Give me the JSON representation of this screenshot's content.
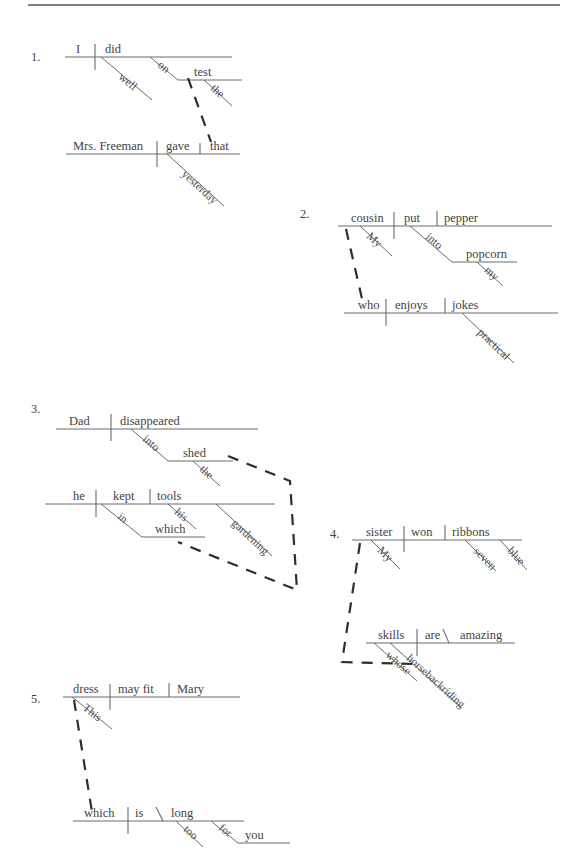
{
  "page": {
    "top_rule": {
      "x1": 28,
      "x2": 560,
      "y": 5
    }
  },
  "items": [
    {
      "number": "1.",
      "number_pos": {
        "x": 31,
        "y": 61
      },
      "clauses": [
        {
          "name": "main-clause",
          "baseline": {
            "x1": 65,
            "x2": 232,
            "y": 57
          },
          "subject": {
            "text": "I",
            "x": 76,
            "y": 53
          },
          "verb": {
            "text": "did",
            "x": 105,
            "y": 53
          },
          "subject_verb_divider": {
            "x": 95,
            "y1": 44,
            "y2": 70
          },
          "modifiers": [
            {
              "text": "well",
              "x1": 101,
              "y1": 57,
              "x2": 152,
              "y2": 100,
              "label_x": 118,
              "label_y": 78
            },
            {
              "text": "on",
              "x1": 150,
              "y1": 57,
              "x2": 178,
              "y2": 80,
              "label_x": 157,
              "label_y": 66
            }
          ],
          "object_line": {
            "text": "test",
            "x1": 178,
            "x2": 242,
            "y": 80,
            "label_x": 194,
            "label_y": 76
          },
          "object_modifier": {
            "text": "the",
            "x1": 204,
            "y1": 80,
            "x2": 232,
            "y2": 106,
            "label_x": 210,
            "label_y": 89
          }
        },
        {
          "name": "relative-clause",
          "baseline": {
            "x1": 66,
            "x2": 240,
            "y": 154
          },
          "subject": {
            "text": "Mrs. Freeman",
            "x": 73,
            "y": 150
          },
          "verb": {
            "text": "gave",
            "x": 166,
            "y": 150
          },
          "object": {
            "text": "that",
            "x": 210,
            "y": 150
          },
          "subject_verb_divider": {
            "x": 157,
            "y1": 141,
            "y2": 167
          },
          "verb_object_divider": {
            "x": 200,
            "y1": 143,
            "y2": 154
          },
          "modifiers": [
            {
              "text": "yesterday",
              "x1": 167,
              "y1": 154,
              "x2": 224,
              "y2": 206,
              "label_x": 181,
              "label_y": 175
            }
          ]
        }
      ],
      "dashed_connector": {
        "points": "188,78 211,142"
      }
    },
    {
      "number": "2.",
      "number_pos": {
        "x": 300,
        "y": 218
      },
      "clauses": [
        {
          "name": "main-clause",
          "baseline": {
            "x1": 338,
            "x2": 552,
            "y": 226
          },
          "subject": {
            "text": "cousin",
            "x": 351,
            "y": 222
          },
          "verb": {
            "text": "put",
            "x": 404,
            "y": 222
          },
          "object": {
            "text": "pepper",
            "x": 444,
            "y": 222
          },
          "subject_verb_divider": {
            "x": 394,
            "y1": 212,
            "y2": 239
          },
          "verb_object_divider": {
            "x": 437,
            "y1": 211,
            "y2": 226
          },
          "modifiers": [
            {
              "text": "My",
              "x1": 360,
              "y1": 226,
              "x2": 392,
              "y2": 256,
              "label_x": 366,
              "label_y": 237
            },
            {
              "text": "into",
              "x1": 410,
              "y1": 226,
              "x2": 452,
              "y2": 262,
              "label_x": 425,
              "label_y": 238
            }
          ],
          "object_line": {
            "text": "popcorn",
            "x1": 452,
            "x2": 517,
            "y": 262,
            "label_x": 466,
            "label_y": 258
          },
          "object_modifier": {
            "text": "my",
            "x1": 477,
            "y1": 262,
            "x2": 503,
            "y2": 286,
            "label_x": 484,
            "label_y": 271
          }
        },
        {
          "name": "relative-clause",
          "baseline": {
            "x1": 344,
            "x2": 558,
            "y": 313
          },
          "subject": {
            "text": "who",
            "x": 358,
            "y": 309
          },
          "verb": {
            "text": "enjoys",
            "x": 395,
            "y": 309
          },
          "object": {
            "text": "jokes",
            "x": 452,
            "y": 309
          },
          "subject_verb_divider": {
            "x": 386,
            "y1": 299,
            "y2": 326
          },
          "verb_object_divider": {
            "x": 445,
            "y1": 298,
            "y2": 313
          },
          "modifiers": [
            {
              "text": "practical",
              "x1": 462,
              "y1": 313,
              "x2": 514,
              "y2": 363,
              "label_x": 477,
              "label_y": 333
            }
          ]
        }
      ],
      "dashed_connector": {
        "points": "346,229 363,303"
      }
    },
    {
      "number": "3.",
      "number_pos": {
        "x": 31,
        "y": 413
      },
      "clauses": [
        {
          "name": "main-clause",
          "baseline": {
            "x1": 56,
            "x2": 258,
            "y": 429
          },
          "subject": {
            "text": "Dad",
            "x": 69,
            "y": 425
          },
          "verb": {
            "text": "disappeared",
            "x": 120,
            "y": 425
          },
          "subject_verb_divider": {
            "x": 111,
            "y1": 414,
            "y2": 441
          },
          "modifiers": [
            {
              "text": "into",
              "x1": 131,
              "y1": 429,
              "x2": 168,
              "y2": 461,
              "label_x": 142,
              "label_y": 440
            }
          ],
          "object_line": {
            "text": "shed",
            "x1": 168,
            "x2": 233,
            "y": 461,
            "label_x": 183,
            "label_y": 457
          },
          "object_modifier": {
            "text": "the",
            "x1": 193,
            "y1": 461,
            "x2": 220,
            "y2": 486,
            "label_x": 199,
            "label_y": 470
          }
        },
        {
          "name": "relative-clause",
          "baseline": {
            "x1": 45,
            "x2": 275,
            "y": 504
          },
          "subject": {
            "text": "he",
            "x": 73,
            "y": 500
          },
          "verb": {
            "text": "kept",
            "x": 113,
            "y": 500
          },
          "object": {
            "text": "tools",
            "x": 157,
            "y": 500
          },
          "subject_verb_divider": {
            "x": 96,
            "y1": 490,
            "y2": 517
          },
          "verb_object_divider": {
            "x": 150,
            "y1": 489,
            "y2": 504
          },
          "modifiers": [
            {
              "text": "in",
              "x1": 101,
              "y1": 504,
              "x2": 142,
              "y2": 537,
              "label_x": 117,
              "label_y": 518
            },
            {
              "text": "his",
              "x1": 168,
              "y1": 504,
              "x2": 196,
              "y2": 529,
              "label_x": 174,
              "label_y": 513
            },
            {
              "text": "gardening",
              "x1": 216,
              "y1": 504,
              "x2": 272,
              "y2": 556,
              "label_x": 231,
              "label_y": 524
            }
          ],
          "object_line": {
            "text": "which",
            "x1": 142,
            "x2": 205,
            "y": 537,
            "label_x": 155,
            "label_y": 533
          }
        }
      ],
      "dashed_connector": {
        "points": "228,456 290,481 297,590 178,542"
      }
    },
    {
      "number": "4.",
      "number_pos": {
        "x": 330,
        "y": 538
      },
      "clauses": [
        {
          "name": "main-clause",
          "baseline": {
            "x1": 352,
            "x2": 522,
            "y": 540
          },
          "subject": {
            "text": "sister",
            "x": 366,
            "y": 536
          },
          "verb": {
            "text": "won",
            "x": 411,
            "y": 536
          },
          "object": {
            "text": "ribbons",
            "x": 452,
            "y": 536
          },
          "subject_verb_divider": {
            "x": 404,
            "y1": 526,
            "y2": 552
          },
          "verb_object_divider": {
            "x": 445,
            "y1": 525,
            "y2": 540
          },
          "modifiers": [
            {
              "text": "My",
              "x1": 371,
              "y1": 540,
              "x2": 400,
              "y2": 569,
              "label_x": 377,
              "label_y": 551
            },
            {
              "text": "seven",
              "x1": 465,
              "y1": 540,
              "x2": 496,
              "y2": 571,
              "label_x": 473,
              "label_y": 552
            },
            {
              "text": "blue",
              "x1": 500,
              "y1": 540,
              "x2": 527,
              "y2": 570,
              "label_x": 507,
              "label_y": 551
            }
          ]
        },
        {
          "name": "relative-clause",
          "baseline": {
            "x1": 366,
            "x2": 515,
            "y": 643
          },
          "subject": {
            "text": "skills",
            "x": 378,
            "y": 639
          },
          "verb": {
            "text": "are",
            "x": 425,
            "y": 639
          },
          "complement": {
            "text": "amazing",
            "x": 460,
            "y": 639
          },
          "subject_verb_divider": {
            "x": 417,
            "y1": 629,
            "y2": 656
          },
          "predicate_slash": {
            "x1": 449,
            "y1": 643,
            "x2": 443,
            "y2": 629
          },
          "modifiers": [
            {
              "text": "whose",
              "x1": 374,
              "y1": 643,
              "x2": 417,
              "y2": 681,
              "label_x": 385,
              "label_y": 656
            },
            {
              "text": "horsebackriding",
              "x1": 390,
              "y1": 643,
              "x2": 462,
              "y2": 708,
              "label_x": 406,
              "label_y": 659
            }
          ]
        }
      ],
      "dashed_connector": {
        "points": "360,543 342,662 412,664"
      }
    },
    {
      "number": "5.",
      "number_pos": {
        "x": 31,
        "y": 703
      },
      "clauses": [
        {
          "name": "main-clause",
          "baseline": {
            "x1": 63,
            "x2": 240,
            "y": 697
          },
          "subject": {
            "text": "dress",
            "x": 73,
            "y": 693
          },
          "verb": {
            "text": "may fit",
            "x": 118,
            "y": 693
          },
          "object": {
            "text": "Mary",
            "x": 177,
            "y": 693
          },
          "subject_verb_divider": {
            "x": 110,
            "y1": 684,
            "y2": 710
          },
          "verb_object_divider": {
            "x": 169,
            "y1": 683,
            "y2": 697
          },
          "modifiers": [
            {
              "text": "This",
              "x1": 72,
              "y1": 697,
              "x2": 112,
              "y2": 729,
              "label_x": 82,
              "label_y": 709
            }
          ]
        },
        {
          "name": "relative-clause",
          "baseline": {
            "x1": 73,
            "x2": 244,
            "y": 821
          },
          "subject": {
            "text": "which",
            "x": 84,
            "y": 817
          },
          "verb": {
            "text": "is",
            "x": 135,
            "y": 817
          },
          "complement": {
            "text": "long",
            "x": 171,
            "y": 817
          },
          "subject_verb_divider": {
            "x": 128,
            "y1": 807,
            "y2": 834
          },
          "predicate_slash": {
            "x1": 163,
            "y1": 821,
            "x2": 156,
            "y2": 807
          },
          "modifiers": [
            {
              "text": "too",
              "x1": 176,
              "y1": 821,
              "x2": 203,
              "y2": 847,
              "label_x": 183,
              "label_y": 830
            },
            {
              "text": "for",
              "x1": 211,
              "y1": 821,
              "x2": 238,
              "y2": 843,
              "label_x": 218,
              "label_y": 829
            }
          ],
          "object_line": {
            "text": "you",
            "x1": 238,
            "x2": 290,
            "y": 843,
            "label_x": 245,
            "label_y": 839
          }
        }
      ],
      "dashed_connector": {
        "points": "74,700 92,812"
      }
    }
  ]
}
